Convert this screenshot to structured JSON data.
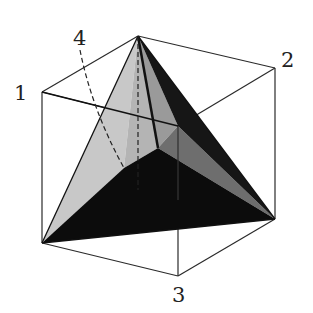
{
  "figure": {
    "labels": [
      {
        "id": "1",
        "text": "1",
        "x": 20,
        "y": 100
      },
      {
        "id": "2",
        "text": "2",
        "x": 281,
        "y": 67
      },
      {
        "id": "3",
        "text": "3",
        "x": 172,
        "y": 302
      },
      {
        "id": "4",
        "text": "4",
        "x": 73,
        "y": 45
      }
    ],
    "colors": {
      "edge": "#2a2a2a",
      "face_light": "#c8c8c8",
      "face_mid": "#6e6e6e",
      "face_dark": "#161616",
      "face_darker": "#0c0c0c",
      "face_grey": "#8a8a8a"
    }
  }
}
